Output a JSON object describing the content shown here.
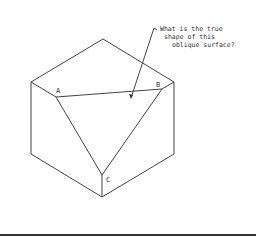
{
  "diagram": {
    "labels": {
      "a": "A",
      "b": "B",
      "c": "C"
    },
    "note": {
      "line1": "What is the true",
      "line2": "shape of this",
      "line3": "oblique surface?"
    },
    "stroke_color": "#444444"
  }
}
